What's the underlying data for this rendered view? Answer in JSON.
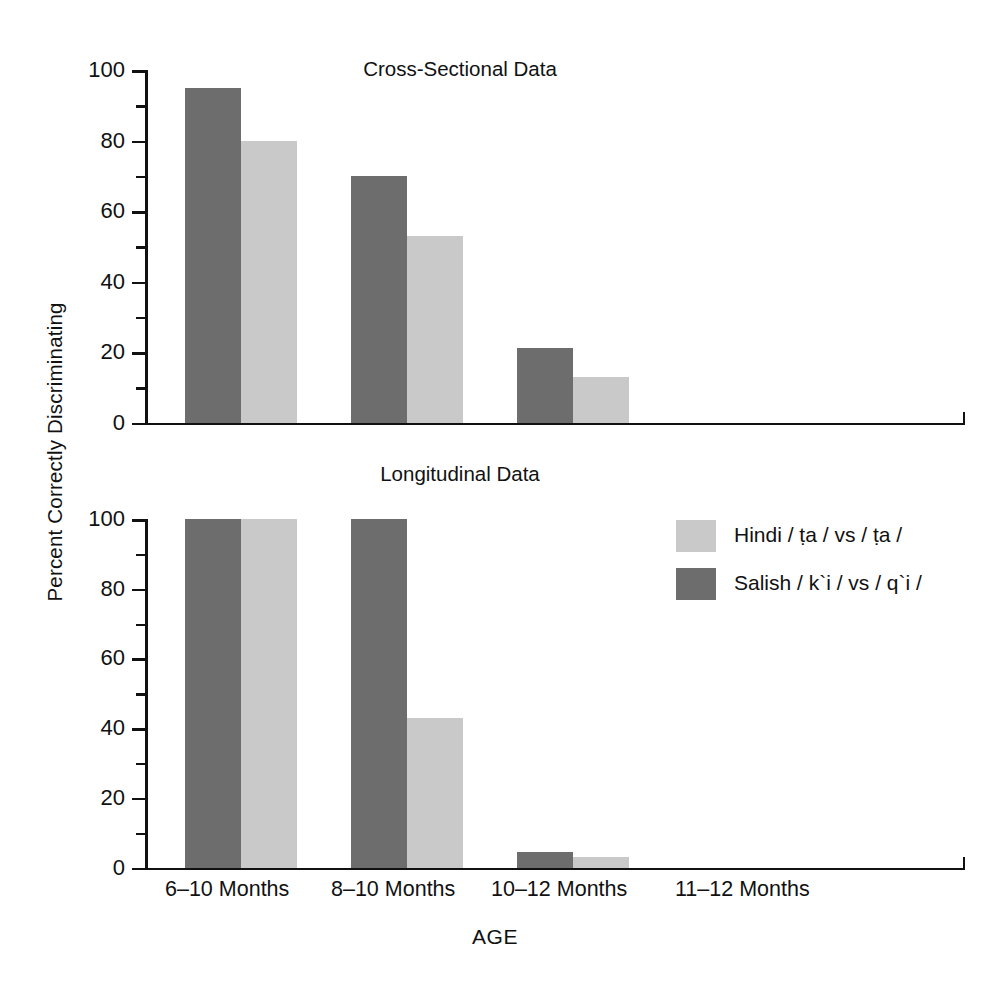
{
  "figure": {
    "ylabel": "Percent Correctly Discriminating",
    "xlabel": "AGE",
    "colors": {
      "dark": "#6d6d6d",
      "light": "#c9c9c9",
      "axis": "#111111",
      "background": "#ffffff"
    }
  },
  "legend": {
    "position": "right-middle",
    "entries": [
      {
        "label": "Hindi  / ṭa / vs / ṭa /",
        "color_key": "light",
        "series": "Hindi"
      },
      {
        "label": "Salish / k`i / vs / q`i /",
        "color_key": "dark",
        "series": "Salish"
      }
    ]
  },
  "axis": {
    "y_ticks_major": [
      0,
      20,
      40,
      60,
      80,
      100
    ],
    "y_ticks_minor": [
      10,
      30,
      50,
      70,
      90
    ],
    "ylim": [
      0,
      100
    ],
    "categories": [
      "6–10 Months",
      "8–10 Months",
      "10–12 Months",
      "11–12 Months"
    ]
  },
  "chart_data": [
    {
      "type": "bar",
      "title": "Cross-Sectional Data",
      "xlabel": "AGE",
      "ylabel": "Percent Correctly Discriminating",
      "ylim": [
        0,
        100
      ],
      "grid": false,
      "legend": "right-middle",
      "categories": [
        "6–10 Months",
        "8–10 Months",
        "10–12 Months",
        "11–12 Months"
      ],
      "series": [
        {
          "name": "Salish / k`i / vs / q`i /",
          "color": "#6d6d6d",
          "values": [
            95,
            70,
            21,
            null
          ]
        },
        {
          "name": "Hindi  / ṭa / vs / ṭa /",
          "color": "#c9c9c9",
          "values": [
            80,
            53,
            13,
            null
          ]
        }
      ]
    },
    {
      "type": "bar",
      "title": "Longitudinal Data",
      "xlabel": "AGE",
      "ylabel": "Percent Correctly Discriminating",
      "ylim": [
        0,
        100
      ],
      "grid": false,
      "legend": "right-middle",
      "categories": [
        "6–10 Months",
        "8–10 Months",
        "10–12 Months",
        "11–12 Months"
      ],
      "series": [
        {
          "name": "Salish / k`i / vs / q`i /",
          "color": "#6d6d6d",
          "values": [
            100,
            100,
            4.5,
            null
          ]
        },
        {
          "name": "Hindi  / ṭa / vs / ṭa /",
          "color": "#c9c9c9",
          "values": [
            100,
            43,
            3,
            null
          ]
        }
      ]
    }
  ],
  "ticks_text": {
    "t0": "0",
    "t20": "20",
    "t40": "40",
    "t60": "60",
    "t80": "80",
    "t100": "100"
  }
}
